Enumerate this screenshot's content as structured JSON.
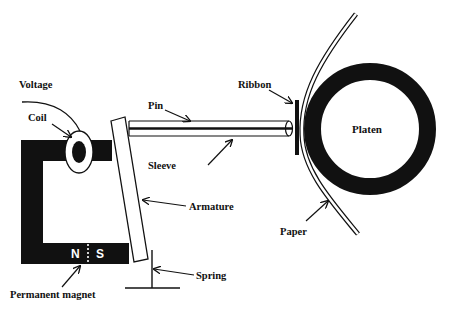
{
  "diagram": {
    "labels": {
      "voltage": "Voltage",
      "coil": "Coil",
      "pin": "Pin",
      "sleeve": "Sleeve",
      "ribbon": "Ribbon",
      "platen": "Platen",
      "armature": "Armature",
      "paper": "Paper",
      "spring": "Spring",
      "permanent_magnet": "Permanent magnet"
    },
    "magnet_poles": {
      "north": "N",
      "south": "S"
    },
    "colors": {
      "ink": "#111111",
      "background": "#ffffff"
    }
  }
}
